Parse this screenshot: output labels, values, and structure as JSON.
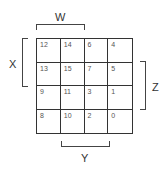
{
  "kmap": {
    "cells": [
      [
        "12",
        "14",
        "6",
        "4"
      ],
      [
        "13",
        "15",
        "7",
        "5"
      ],
      [
        "9",
        "11",
        "3",
        "1"
      ],
      [
        "8",
        "10",
        "2",
        "0"
      ]
    ],
    "labels": {
      "w": "W",
      "x": "X",
      "y": "Y",
      "z": "Z"
    }
  }
}
